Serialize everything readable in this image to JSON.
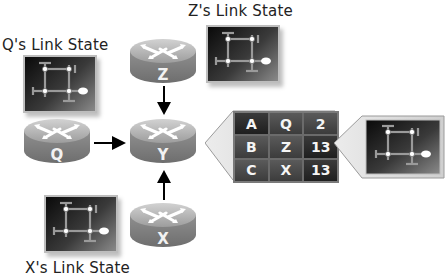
{
  "labels": {
    "z_link_state": "Z's Link State",
    "q_link_state": "Q's Link State",
    "x_link_state": "X's Link State"
  },
  "routers": {
    "z": "Z",
    "q": "Q",
    "y": "Y",
    "x": "X"
  },
  "routing_table": {
    "rows": [
      [
        "A",
        "Q",
        "2"
      ],
      [
        "B",
        "Z",
        "13"
      ],
      [
        "C",
        "X",
        "13"
      ]
    ]
  },
  "colors": {
    "router_body": "#8a8a8a",
    "router_top": "#b5b5b5",
    "link_state_bg": "#1a1a1a",
    "table_cell": "#2a2a2a",
    "text": "#222222"
  }
}
